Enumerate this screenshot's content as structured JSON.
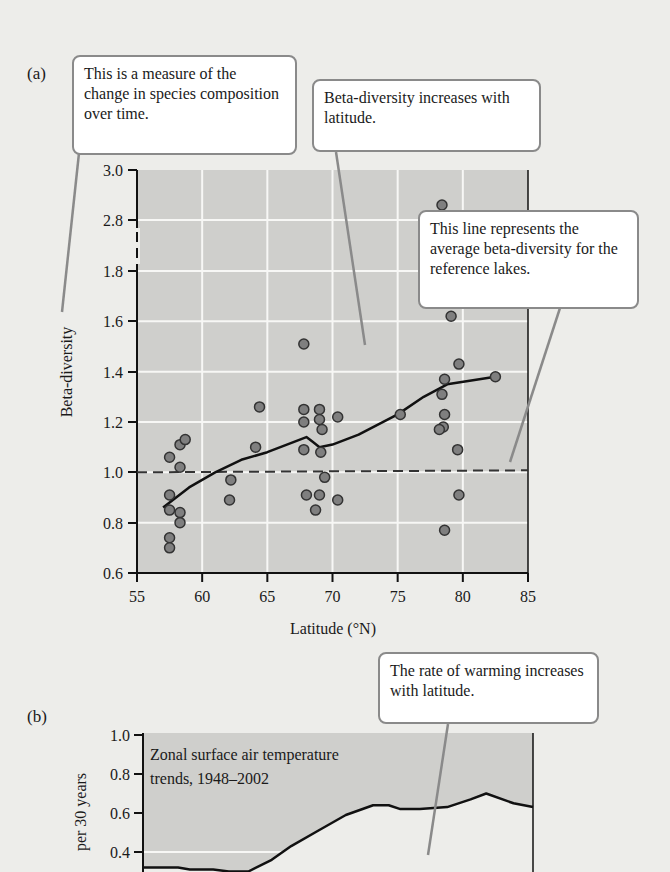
{
  "figure": {
    "panel_a_label": "(a)",
    "panel_b_label": "(b)"
  },
  "callouts": {
    "measure": "This is a measure of the change in species composition over time.",
    "increase": "Beta-diversity increases with latitude.",
    "reference": "This line represents the average beta-diversity for the reference lakes.",
    "warming": "The rate of warming increases with latitude."
  },
  "colors": {
    "plot_bg": "#cfcfcc",
    "paper": "#ededea",
    "grid": "#f7f7f5",
    "point_fill": "#7f7f7f",
    "line": "#111111",
    "callout_border": "#8a8a8a"
  },
  "chart_data": [
    {
      "type": "scatter",
      "title": "",
      "xlabel": "Latitude (°N)",
      "ylabel": "Beta-diversity",
      "xlim": [
        55,
        85
      ],
      "ylim": [
        0.6,
        3.0
      ],
      "x_ticks": [
        55,
        60,
        65,
        70,
        75,
        80,
        85
      ],
      "y_ticks": [
        0.6,
        0.8,
        1.0,
        1.2,
        1.4,
        1.6,
        1.8,
        2.8,
        3.0
      ],
      "y_axis_break": "between 1.8 and 2.8",
      "grid": true,
      "points": [
        {
          "x": 57.5,
          "y": 1.06
        },
        {
          "x": 57.5,
          "y": 0.91
        },
        {
          "x": 57.5,
          "y": 0.85
        },
        {
          "x": 57.5,
          "y": 0.74
        },
        {
          "x": 57.5,
          "y": 0.7
        },
        {
          "x": 58.3,
          "y": 1.02
        },
        {
          "x": 58.3,
          "y": 1.11
        },
        {
          "x": 58.7,
          "y": 1.13
        },
        {
          "x": 58.3,
          "y": 0.84
        },
        {
          "x": 58.3,
          "y": 0.8
        },
        {
          "x": 62.2,
          "y": 0.97
        },
        {
          "x": 62.1,
          "y": 0.89
        },
        {
          "x": 64.1,
          "y": 1.1
        },
        {
          "x": 64.4,
          "y": 1.26
        },
        {
          "x": 67.8,
          "y": 1.51
        },
        {
          "x": 67.8,
          "y": 1.25
        },
        {
          "x": 67.8,
          "y": 1.2
        },
        {
          "x": 67.8,
          "y": 1.09
        },
        {
          "x": 68.0,
          "y": 0.91
        },
        {
          "x": 68.7,
          "y": 0.85
        },
        {
          "x": 69.0,
          "y": 1.25
        },
        {
          "x": 69.0,
          "y": 1.21
        },
        {
          "x": 69.2,
          "y": 1.17
        },
        {
          "x": 69.1,
          "y": 1.08
        },
        {
          "x": 69.4,
          "y": 0.98
        },
        {
          "x": 69.0,
          "y": 0.91
        },
        {
          "x": 70.4,
          "y": 1.22
        },
        {
          "x": 70.4,
          "y": 0.89
        },
        {
          "x": 75.2,
          "y": 1.23
        },
        {
          "x": 78.4,
          "y": 2.86
        },
        {
          "x": 78.4,
          "y": 1.31
        },
        {
          "x": 78.6,
          "y": 1.37
        },
        {
          "x": 78.6,
          "y": 1.23
        },
        {
          "x": 78.5,
          "y": 1.18
        },
        {
          "x": 78.2,
          "y": 1.17
        },
        {
          "x": 79.1,
          "y": 1.62
        },
        {
          "x": 79.7,
          "y": 1.43
        },
        {
          "x": 79.6,
          "y": 1.09
        },
        {
          "x": 79.7,
          "y": 0.91
        },
        {
          "x": 78.6,
          "y": 0.77
        },
        {
          "x": 82.5,
          "y": 1.38
        }
      ],
      "trend_line": {
        "name": "average trend",
        "x": [
          57,
          59,
          61,
          63,
          65,
          67,
          68,
          68.5,
          69,
          70,
          72,
          75,
          77,
          78.8,
          82.5
        ],
        "y": [
          0.86,
          0.94,
          1.0,
          1.05,
          1.08,
          1.12,
          1.14,
          1.12,
          1.1,
          1.11,
          1.15,
          1.23,
          1.3,
          1.35,
          1.38
        ]
      },
      "reference_line": {
        "name": "average beta-diversity for the reference lakes",
        "y": 1.0,
        "style": "dashed"
      }
    },
    {
      "type": "area",
      "title": "Zonal surface air temperature trends, 1948–2002",
      "ylabel": "per 30 years",
      "ylim_visible": [
        0.3,
        1.0
      ],
      "y_ticks": [
        0.4,
        0.6,
        0.8,
        1.0
      ],
      "grid": true,
      "series": [
        {
          "name": "warming trend",
          "x_fraction": [
            0,
            0.09,
            0.12,
            0.18,
            0.22,
            0.27,
            0.33,
            0.38,
            0.45,
            0.52,
            0.59,
            0.63,
            0.66,
            0.71,
            0.78,
            0.84,
            0.88,
            0.95,
            1.0
          ],
          "values": [
            0.32,
            0.32,
            0.31,
            0.31,
            0.3,
            0.3,
            0.36,
            0.43,
            0.51,
            0.59,
            0.64,
            0.64,
            0.62,
            0.62,
            0.63,
            0.67,
            0.7,
            0.65,
            0.63
          ]
        }
      ]
    }
  ]
}
